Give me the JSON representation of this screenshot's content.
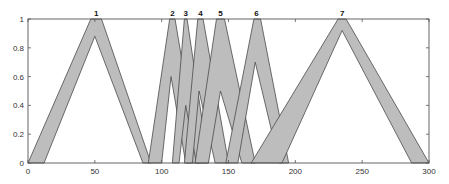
{
  "chart_data": {
    "type": "area",
    "title": "",
    "xlabel": "",
    "ylabel": "",
    "xlim": [
      0,
      300
    ],
    "ylim": [
      0,
      1
    ],
    "grid": false,
    "legend": null,
    "x_ticks": [
      0,
      50,
      100,
      150,
      200,
      250,
      300
    ],
    "y_ticks": [
      0,
      0.2,
      0.4,
      0.6,
      0.8,
      1
    ],
    "y_tick_labels": [
      "0",
      "0.2",
      "0.4",
      "0.6",
      "0.8",
      "1"
    ],
    "fill_color": "#bdbdbd",
    "edge_color": "#4a4a4a",
    "series": [
      {
        "name": "1",
        "umf": [
          [
            0,
            0
          ],
          [
            47,
            1
          ],
          [
            55,
            1
          ],
          [
            92,
            0
          ]
        ],
        "lmf": [
          [
            12,
            0
          ],
          [
            50,
            0.88
          ],
          [
            86,
            0
          ]
        ]
      },
      {
        "name": "2",
        "umf": [
          [
            90,
            0
          ],
          [
            106,
            1
          ],
          [
            110,
            1
          ],
          [
            128,
            0
          ]
        ],
        "lmf": [
          [
            100,
            0
          ],
          [
            107,
            0.6
          ],
          [
            118,
            0
          ]
        ]
      },
      {
        "name": "3",
        "umf": [
          [
            108,
            0
          ],
          [
            117,
            1
          ],
          [
            119,
            1
          ],
          [
            135,
            0
          ]
        ],
        "lmf": [
          [
            113,
            0
          ],
          [
            118,
            0.4
          ],
          [
            126,
            0
          ]
        ]
      },
      {
        "name": "4",
        "umf": [
          [
            117,
            0
          ],
          [
            127,
            1
          ],
          [
            131,
            1
          ],
          [
            150,
            0
          ]
        ],
        "lmf": [
          [
            123,
            0
          ],
          [
            128,
            0.5
          ],
          [
            140,
            0
          ]
        ]
      },
      {
        "name": "5",
        "umf": [
          [
            125,
            0
          ],
          [
            141,
            1
          ],
          [
            147,
            1
          ],
          [
            170,
            0
          ]
        ],
        "lmf": [
          [
            135,
            0
          ],
          [
            144,
            0.5
          ],
          [
            160,
            0
          ]
        ]
      },
      {
        "name": "6",
        "umf": [
          [
            148,
            0
          ],
          [
            169,
            1
          ],
          [
            174,
            1
          ],
          [
            195,
            0
          ]
        ],
        "lmf": [
          [
            157,
            0
          ],
          [
            170,
            0.7
          ],
          [
            188,
            0
          ]
        ]
      },
      {
        "name": "7",
        "umf": [
          [
            167,
            0
          ],
          [
            232,
            1
          ],
          [
            238,
            1
          ],
          [
            300,
            0
          ]
        ],
        "lmf": [
          [
            190,
            0
          ],
          [
            235,
            0.92
          ],
          [
            287,
            0
          ]
        ]
      }
    ],
    "annotations": [
      {
        "text": "1",
        "x": 51,
        "y": 1
      },
      {
        "text": "2",
        "x": 108,
        "y": 1
      },
      {
        "text": "3",
        "x": 118,
        "y": 1
      },
      {
        "text": "4",
        "x": 129,
        "y": 1
      },
      {
        "text": "5",
        "x": 144,
        "y": 1
      },
      {
        "text": "6",
        "x": 171,
        "y": 1
      },
      {
        "text": "7",
        "x": 235,
        "y": 1
      }
    ]
  }
}
